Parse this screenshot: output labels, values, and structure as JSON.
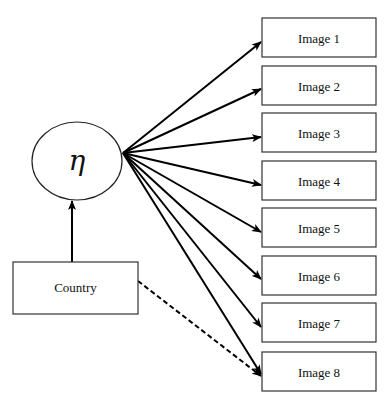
{
  "diagram": {
    "type": "path-diagram",
    "latent": {
      "symbol": "η",
      "cx": 77,
      "cy": 161,
      "rx": 45,
      "ry": 39
    },
    "covariate": {
      "label": "Country",
      "x": 13,
      "y": 262,
      "w": 125,
      "h": 52
    },
    "fan_origin": {
      "x": 123,
      "y": 153
    },
    "indicators": [
      {
        "label": "Image 1",
        "y": 18,
        "arrow_y": 42
      },
      {
        "label": "Image 2",
        "y": 66,
        "arrow_y": 89
      },
      {
        "label": "Image 3",
        "y": 113,
        "arrow_y": 137
      },
      {
        "label": "Image 4",
        "y": 161,
        "arrow_y": 185
      },
      {
        "label": "Image 5",
        "y": 208,
        "arrow_y": 232
      },
      {
        "label": "Image 6",
        "y": 256,
        "arrow_y": 279
      },
      {
        "label": "Image 7",
        "y": 303,
        "arrow_y": 327
      },
      {
        "label": "Image 8",
        "y": 352,
        "arrow_y": 374
      }
    ],
    "indicator_box": {
      "x": 262,
      "w": 114,
      "h": 39
    },
    "edges": [
      {
        "from": "Country",
        "to": "η",
        "style": "solid"
      },
      {
        "from": "η",
        "to": "Image 1..8",
        "style": "solid"
      },
      {
        "from": "Country",
        "to": "Image 8",
        "style": "dashed"
      }
    ]
  }
}
